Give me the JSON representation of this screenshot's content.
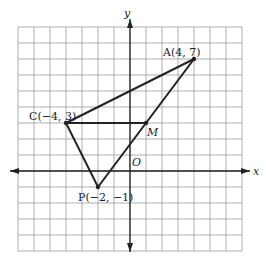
{
  "figure": {
    "grid": {
      "x_min": -7,
      "x_max": 7,
      "y_min": -5,
      "y_max": 9,
      "cell_px": 16,
      "line_color": "#9a9a9a"
    },
    "axes": {
      "x_label": "x",
      "y_label": "y",
      "origin_label": "O",
      "color": "#222222"
    },
    "points": [
      {
        "name": "A",
        "x": 4,
        "y": 7,
        "label": "A(4, 7)"
      },
      {
        "name": "C",
        "x": -4,
        "y": 3,
        "label": "C(−4, 3)"
      },
      {
        "name": "P",
        "x": -2,
        "y": -1,
        "label": "P(−2, −1)"
      },
      {
        "name": "M",
        "x": 1,
        "y": 3,
        "label": "M"
      }
    ],
    "segments": [
      [
        "C",
        "A"
      ],
      [
        "A",
        "P"
      ],
      [
        "P",
        "C"
      ],
      [
        "C",
        "M"
      ]
    ],
    "stroke_color": "#222222"
  }
}
